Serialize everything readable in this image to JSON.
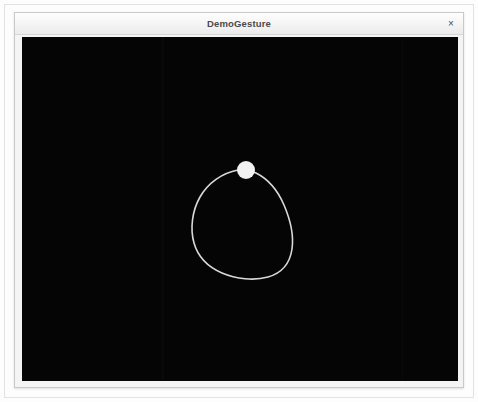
{
  "window": {
    "title": "DemoGesture",
    "close_label": "×",
    "close_icon": "close-icon",
    "frame_color": "#c9c9c9",
    "titlebar_color": "#f3f3f3",
    "title_text_color": "#4a4a4a"
  },
  "canvas": {
    "background_color": "#050505",
    "stroke_color": "#d9d9d9",
    "cursor_color": "#f2f2f2",
    "width": 436,
    "height": 344,
    "description": "black gesture drawing surface",
    "gesture": {
      "name": "hand-drawn-circle",
      "stroke_width": 1.6,
      "path": "M 216 133 C 200 136 186 146 178 160 C 170 174 168 192 172 206 C 176 220 186 230 200 236 C 214 242 232 244 246 240 C 260 236 268 226 270 212 C 272 198 268 182 262 168 C 256 154 246 142 234 136 C 228 133 222 132 216 133 Z",
      "cursor_point": {
        "x": 224,
        "y": 133,
        "radius": 9
      }
    }
  }
}
